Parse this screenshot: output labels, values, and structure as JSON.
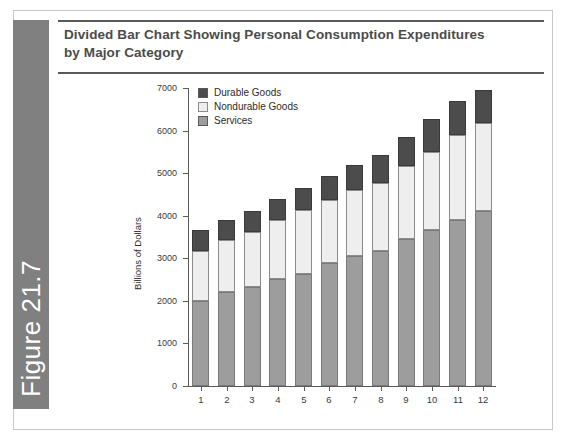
{
  "figure": {
    "band_label": "Figure 21.7",
    "band_color": "#808080",
    "title_line_1": "Divided Bar Chart Showing Personal Consumption Expenditures",
    "title_line_2": "by Major Category"
  },
  "legend": {
    "items": [
      {
        "label": "Durable Goods",
        "color": "#4c4c4c",
        "icon": "legend-swatch-durable"
      },
      {
        "label": "Nondurable Goods",
        "color": "#eeeeee",
        "icon": "legend-swatch-nondurable"
      },
      {
        "label": "Services",
        "color": "#9d9d9d",
        "icon": "legend-swatch-services"
      }
    ]
  },
  "chart_data": {
    "type": "bar",
    "title": "Divided Bar Chart Showing Personal Consumption Expenditures by Major Category",
    "stacked": true,
    "xlabel": "",
    "ylabel": "Billions of Dollars",
    "categories": [
      "1",
      "2",
      "3",
      "4",
      "5",
      "6",
      "7",
      "8",
      "9",
      "10",
      "11",
      "12"
    ],
    "ytick_labels": [
      "0",
      "1000",
      "2000",
      "3000",
      "4000",
      "5000",
      "6000",
      "7000"
    ],
    "yticks": [
      0,
      1000,
      2000,
      3000,
      4000,
      5000,
      6000,
      7000
    ],
    "ylim": [
      0,
      7000
    ],
    "grid": false,
    "legend_position": "upper-left-inside",
    "series": [
      {
        "name": "Services",
        "color": "#9d9d9d",
        "values": [
          1990,
          2210,
          2330,
          2510,
          2640,
          2880,
          3050,
          3160,
          3450,
          3670,
          3910,
          4110
        ]
      },
      {
        "name": "Nondurable Goods",
        "color": "#eeeeee",
        "values": [
          1190,
          1230,
          1280,
          1380,
          1490,
          1500,
          1560,
          1610,
          1720,
          1830,
          1980,
          2070
        ]
      },
      {
        "name": "Durable Goods",
        "color": "#4c4c4c",
        "values": [
          490,
          450,
          490,
          510,
          520,
          560,
          590,
          650,
          690,
          780,
          800,
          780
        ]
      }
    ],
    "totals": [
      3670,
      3890,
      4100,
      4400,
      4650,
      4940,
      5200,
      5420,
      5860,
      6280,
      6690,
      6960
    ]
  }
}
